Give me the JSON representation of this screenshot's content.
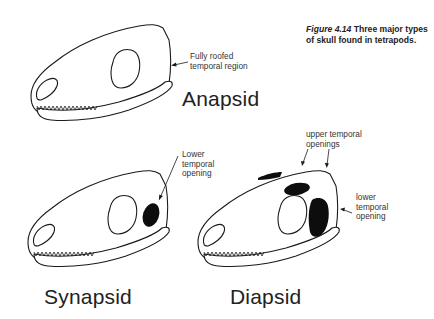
{
  "caption": {
    "figure_number": "Figure 4.14",
    "text": "Three major types of skull found in tetrapods."
  },
  "skulls": [
    {
      "name": "Anapsid",
      "annotations": [
        {
          "text_line1": "Fully roofed",
          "text_line2": "temporal region"
        }
      ]
    },
    {
      "name": "Synapsid",
      "annotations": [
        {
          "text_line1": "Lower",
          "text_line2": "temporal",
          "text_line3": "opening"
        }
      ]
    },
    {
      "name": "Diapsid",
      "annotations": [
        {
          "text_line1": "upper temporal",
          "text_line2": "openings"
        },
        {
          "text_line1": "lower",
          "text_line2": "temporal",
          "text_line3": "opening"
        }
      ]
    }
  ],
  "colors": {
    "line": "#1a1a1a",
    "fill_opening": "#0d0d0d",
    "background": "#ffffff"
  }
}
